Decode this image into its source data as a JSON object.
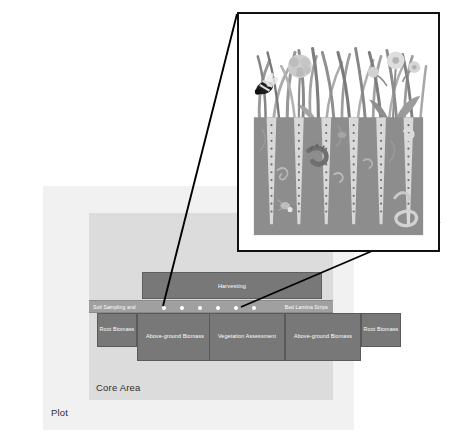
{
  "figure": {
    "kind": "field-experiment-plot-diagram",
    "plot": {
      "label": "Plot",
      "fill_color": "#f1f1f1"
    },
    "core_area": {
      "label": "Core Area",
      "fill_color": "#dcdcdc"
    },
    "harvesting_band": {
      "label": "Harvesting",
      "fill_color": "#787878",
      "text_color": "#ffffff"
    },
    "sampling_strip": {
      "label_left": "Soil Sampling and",
      "label_right": "Bed Lamina Strips",
      "fill_color": "#a0a0a0",
      "text_color": "#ffffff",
      "sample_point_count": 6,
      "sample_point_color": "#ffffff"
    },
    "quadrat_boxes": [
      {
        "label": "Root Biomass",
        "size": "small",
        "fill_color": "#787878"
      },
      {
        "label": "Above-ground Biomass",
        "size": "large",
        "fill_color": "#787878"
      },
      {
        "label": "Vegetation Assessment",
        "size": "large",
        "fill_color": "#787878"
      },
      {
        "label": "Above-ground Biomass",
        "size": "large",
        "fill_color": "#787878"
      },
      {
        "label": "Root Biomass",
        "size": "small",
        "fill_color": "#787878"
      }
    ],
    "inset": {
      "kind": "soil-profile-illustration",
      "frame_border_color": "#111111",
      "frame_background": "#ffffff",
      "soil_color": "#8d8d8d",
      "strip_color": "#d8d8d8",
      "strip_count": 6,
      "perforation_dot_color": "#6e6e6e",
      "vegetation": [
        "grass-blades",
        "clover-flower",
        "dandelion-flower",
        "buttercup-flower",
        "broadleaf-herb"
      ],
      "fauna": [
        "bee",
        "earthworm",
        "beetle-larva",
        "springtail",
        "nematode"
      ],
      "callout_line_count": 2,
      "callout_line_color": "#000000"
    }
  }
}
